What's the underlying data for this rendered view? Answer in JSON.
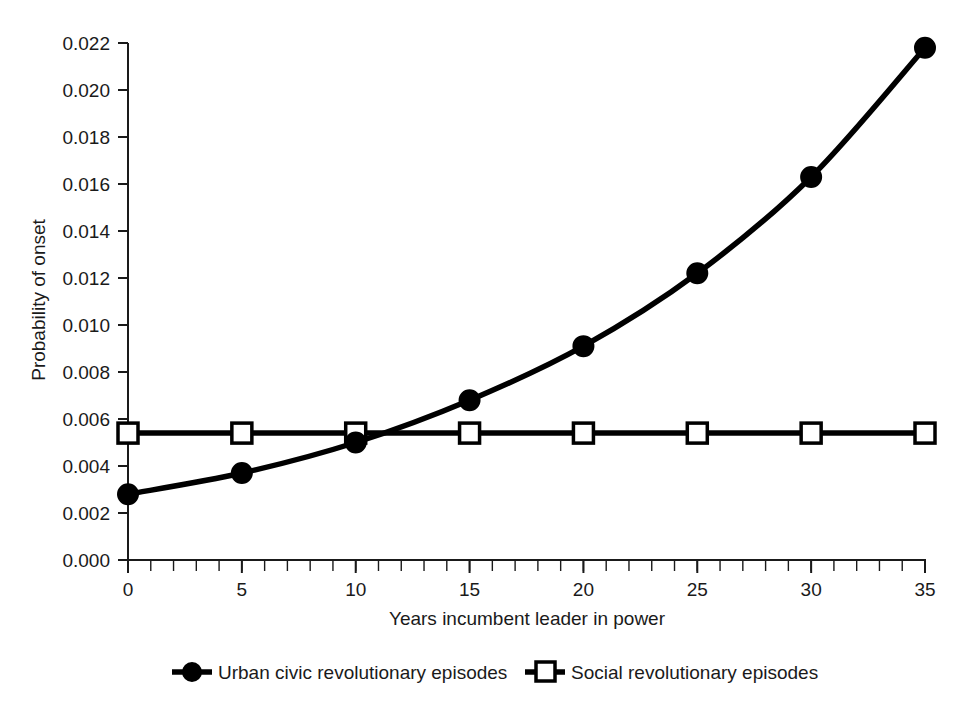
{
  "chart_data": {
    "type": "line",
    "title": "",
    "xlabel": "Years incumbent leader in power",
    "ylabel": "Probability of onset",
    "xlim": [
      0,
      35
    ],
    "ylim": [
      0.0,
      0.022
    ],
    "xticks": [
      "0",
      "5",
      "10",
      "15",
      "20",
      "25",
      "30",
      "35"
    ],
    "xtick_values": [
      0,
      5,
      10,
      15,
      20,
      25,
      30,
      35
    ],
    "x_minor_tick_step": 1,
    "yticks": [
      "0.000",
      "0.002",
      "0.004",
      "0.006",
      "0.008",
      "0.010",
      "0.012",
      "0.014",
      "0.016",
      "0.018",
      "0.020",
      "0.022"
    ],
    "ytick_values": [
      0.0,
      0.002,
      0.004,
      0.006,
      0.008,
      0.01,
      0.012,
      0.014,
      0.016,
      0.018,
      0.02,
      0.022
    ],
    "grid": false,
    "legend_position": "bottom",
    "x": [
      0,
      5,
      10,
      15,
      20,
      25,
      30,
      35
    ],
    "series": [
      {
        "name": "Urban civic revolutionary episodes",
        "marker": "filled-circle",
        "color": "#000000",
        "values": [
          0.0028,
          0.0037,
          0.005,
          0.0068,
          0.0091,
          0.0122,
          0.0163,
          0.0218
        ]
      },
      {
        "name": "Social revolutionary episodes",
        "marker": "open-square",
        "color": "#000000",
        "values": [
          0.0054,
          0.0054,
          0.0054,
          0.0054,
          0.0054,
          0.0054,
          0.0054,
          0.0054
        ]
      }
    ]
  },
  "legend": {
    "items": [
      {
        "label": "Urban civic revolutionary episodes",
        "marker": "filled-circle"
      },
      {
        "label": "Social revolutionary episodes",
        "marker": "open-square"
      }
    ]
  },
  "axes": {
    "x_title": "Years incumbent leader in power",
    "y_title": "Probability of onset"
  }
}
